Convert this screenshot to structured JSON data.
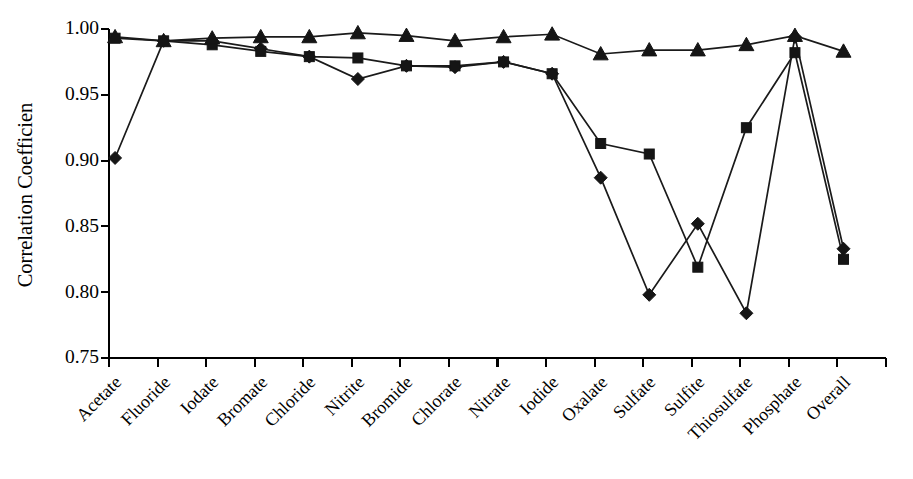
{
  "chart_data": {
    "type": "line",
    "title": "",
    "xlabel": "",
    "ylabel": "Correlation Coefficien",
    "ylim": [
      0.75,
      1.0
    ],
    "yticks": [
      0.75,
      0.8,
      0.85,
      0.9,
      0.95,
      1.0
    ],
    "ytick_labels": [
      "0.75",
      "0.80",
      "0.85",
      "0.90",
      "0.95",
      "1.00"
    ],
    "grid": false,
    "legend": "none",
    "categories": [
      "Acetate",
      "Fluoride",
      "Iodate",
      "Bromate",
      "Chloride",
      "Nitrite",
      "Bromide",
      "Chlorate",
      "Nitrate",
      "Iodide",
      "Oxalate",
      "Sulfate",
      "Sulfite",
      "Thiosulfate",
      "Phosphate",
      "Overall"
    ],
    "series": [
      {
        "name": "series-diamond",
        "marker": "diamond",
        "color": "#151515",
        "values": [
          0.902,
          0.991,
          0.991,
          0.985,
          0.979,
          0.962,
          0.972,
          0.971,
          0.975,
          0.966,
          0.887,
          0.798,
          0.852,
          0.784,
          0.994,
          0.833
        ]
      },
      {
        "name": "series-square",
        "marker": "square",
        "color": "#151515",
        "values": [
          0.993,
          0.991,
          0.988,
          0.983,
          0.979,
          0.978,
          0.972,
          0.972,
          0.975,
          0.966,
          0.913,
          0.905,
          0.819,
          0.925,
          0.982,
          0.825
        ]
      },
      {
        "name": "series-triangle",
        "marker": "triangle",
        "color": "#151515",
        "values": [
          0.994,
          0.991,
          0.993,
          0.994,
          0.994,
          0.997,
          0.995,
          0.991,
          0.994,
          0.996,
          0.981,
          0.984,
          0.984,
          0.988,
          0.995,
          0.983
        ]
      }
    ]
  },
  "axes": {
    "y_axis_title": "Correlation Coefficien"
  }
}
